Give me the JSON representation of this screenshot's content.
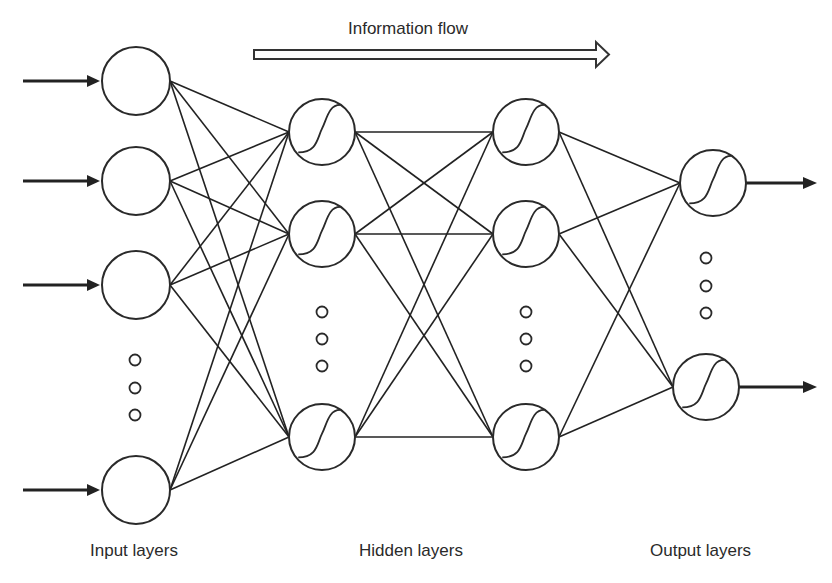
{
  "diagram": {
    "title": "Information flow",
    "colors": {
      "stroke": "#2a2a2a",
      "background": "#ffffff"
    },
    "layers": [
      {
        "id": "input",
        "label": "Input layers",
        "activation": "none",
        "nodes": [
          {
            "cx": 136,
            "cy": 81
          },
          {
            "cx": 136,
            "cy": 181
          },
          {
            "cx": 136,
            "cy": 285
          },
          {
            "cx": 136,
            "cy": 490
          }
        ],
        "radius": 34,
        "ellipsis": [
          {
            "cx": 135,
            "cy": 360
          },
          {
            "cx": 135,
            "cy": 388
          },
          {
            "cx": 135,
            "cy": 415
          }
        ]
      },
      {
        "id": "hidden1",
        "label": "Hidden layers",
        "activation": "sigmoid",
        "nodes": [
          {
            "cx": 322,
            "cy": 132
          },
          {
            "cx": 322,
            "cy": 234
          },
          {
            "cx": 322,
            "cy": 437
          }
        ],
        "radius": 33,
        "ellipsis": [
          {
            "cx": 322,
            "cy": 312
          },
          {
            "cx": 322,
            "cy": 339
          },
          {
            "cx": 322,
            "cy": 366
          }
        ]
      },
      {
        "id": "hidden2",
        "label": "",
        "activation": "sigmoid",
        "nodes": [
          {
            "cx": 526,
            "cy": 132
          },
          {
            "cx": 526,
            "cy": 234
          },
          {
            "cx": 526,
            "cy": 437
          }
        ],
        "radius": 33,
        "ellipsis": [
          {
            "cx": 526,
            "cy": 312
          },
          {
            "cx": 526,
            "cy": 339
          },
          {
            "cx": 526,
            "cy": 366
          }
        ]
      },
      {
        "id": "output",
        "label": "Output layers",
        "activation": "sigmoid",
        "nodes": [
          {
            "cx": 713,
            "cy": 183
          },
          {
            "cx": 706,
            "cy": 387
          }
        ],
        "radius": 33,
        "ellipsis": [
          {
            "cx": 706,
            "cy": 258
          },
          {
            "cx": 706,
            "cy": 286
          },
          {
            "cx": 706,
            "cy": 313
          }
        ]
      }
    ],
    "connectivity": "fully-connected",
    "labels": {
      "flow": "Information flow",
      "input": "Input layers",
      "hidden": "Hidden layers",
      "output": "Output layers"
    }
  }
}
